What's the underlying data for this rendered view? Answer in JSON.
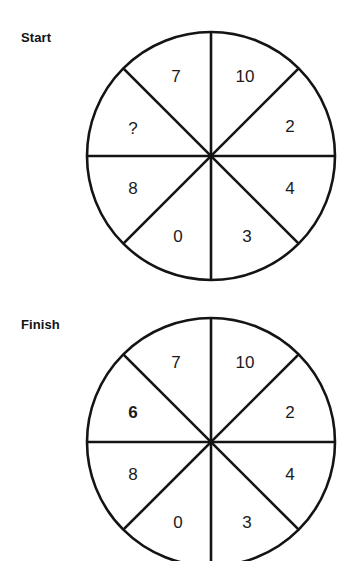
{
  "page": {
    "background": "#ffffff",
    "ink": "#141414",
    "width": 355,
    "height": 561
  },
  "panels": [
    {
      "id": "start",
      "label": "Start",
      "wheel": {
        "center_x": 211,
        "center_y": 156,
        "radius": 124,
        "sectors": [
          {
            "position": "upper-left-of-top",
            "value": "7",
            "bold": false,
            "x": 176,
            "y": 78
          },
          {
            "position": "upper-right-of-top",
            "value": "10",
            "bold": false,
            "x": 245,
            "y": 78
          },
          {
            "position": "right-upper",
            "value": "2",
            "bold": false,
            "x": 290,
            "y": 128
          },
          {
            "position": "right-lower",
            "value": "4",
            "bold": false,
            "x": 290,
            "y": 190
          },
          {
            "position": "lower-right-of-bottom",
            "value": "3",
            "bold": false,
            "x": 247,
            "y": 238
          },
          {
            "position": "lower-left-of-bottom",
            "value": "0",
            "bold": false,
            "x": 178,
            "y": 238
          },
          {
            "position": "left-lower",
            "value": "8",
            "bold": false,
            "x": 133,
            "y": 190
          },
          {
            "position": "left-upper",
            "value": "?",
            "bold": false,
            "x": 133,
            "y": 130
          }
        ]
      }
    },
    {
      "id": "finish",
      "label": "Finish",
      "wheel": {
        "center_x": 211,
        "center_y": 442,
        "radius": 124,
        "sectors": [
          {
            "position": "upper-left-of-top",
            "value": "7",
            "bold": false,
            "x": 176,
            "y": 364
          },
          {
            "position": "upper-right-of-top",
            "value": "10",
            "bold": false,
            "x": 245,
            "y": 364
          },
          {
            "position": "right-upper",
            "value": "2",
            "bold": false,
            "x": 290,
            "y": 414
          },
          {
            "position": "right-lower",
            "value": "4",
            "bold": false,
            "x": 290,
            "y": 476
          },
          {
            "position": "lower-right-of-bottom",
            "value": "3",
            "bold": false,
            "x": 247,
            "y": 524
          },
          {
            "position": "lower-left-of-bottom",
            "value": "0",
            "bold": false,
            "x": 178,
            "y": 524
          },
          {
            "position": "left-lower",
            "value": "8",
            "bold": false,
            "x": 133,
            "y": 476
          },
          {
            "position": "left-upper",
            "value": "6",
            "bold": true,
            "x": 133,
            "y": 414
          }
        ]
      }
    }
  ]
}
